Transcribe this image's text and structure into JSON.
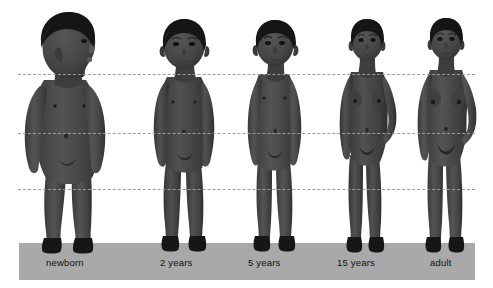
{
  "diagram": {
    "background_color": "#ffffff",
    "ground_bar": {
      "name": "ground-bar",
      "color": "#a9a9a9",
      "x": 19,
      "y": 243,
      "width": 456,
      "height": 37
    },
    "reference_lines": [
      {
        "name": "chin-line",
        "y": 74,
        "style": "dashed",
        "color": "#9b9b9b"
      },
      {
        "name": "navel-line",
        "y": 133,
        "style": "dashed",
        "color": "#9b9b9b"
      },
      {
        "name": "knee-line",
        "y": 189,
        "style": "dashed",
        "color": "#9b9b9b"
      }
    ],
    "colors": {
      "skin": "#4a4a4a",
      "skin_shadow": "#3a3a3a",
      "skin_highlight": "#585858",
      "hair": "#171717",
      "line": "#9b9b9b",
      "ground": "#a9a9a9",
      "label_text": "#111111"
    },
    "figures": [
      {
        "label": "newborn",
        "name": "figure-newborn",
        "label_x": 46,
        "label_y": 263,
        "center_x": 70,
        "head_top": 22,
        "feet_y": 252,
        "pose": "three-quarter profile, head turned right, standing"
      },
      {
        "label": "2 years",
        "name": "figure-2-years",
        "label_x": 160,
        "label_y": 263,
        "center_x": 181,
        "head_top": 27,
        "feet_y": 252,
        "pose": "frontal, arms at sides"
      },
      {
        "label": "5 years",
        "name": "figure-5-years",
        "label_x": 248,
        "label_y": 263,
        "center_x": 271,
        "head_top": 24,
        "feet_y": 252,
        "pose": "frontal, arms at sides"
      },
      {
        "label": "15 years",
        "name": "figure-15-years",
        "label_x": 337,
        "label_y": 263,
        "center_x": 362,
        "head_top": 24,
        "feet_y": 252,
        "pose": "frontal, right hand on hip"
      },
      {
        "label": "adult",
        "name": "figure-adult",
        "label_x": 432,
        "label_y": 263,
        "center_x": 441,
        "head_top": 23,
        "feet_y": 252,
        "pose": "frontal, right hand on hip"
      }
    ]
  }
}
